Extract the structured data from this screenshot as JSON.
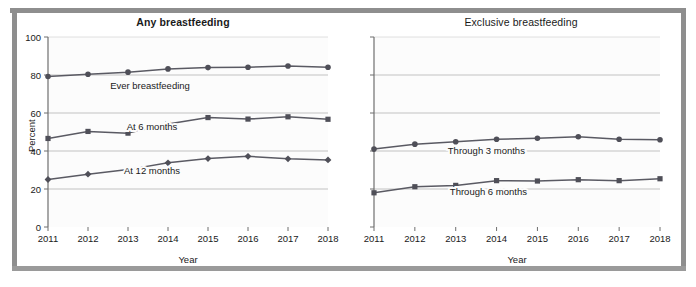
{
  "figure": {
    "background_color": "#ffffff",
    "frame_color": "#8e8e8e",
    "plot_background_color": "#fcfcfc",
    "axis_color": "#6f6f6f",
    "grid_color": "#b4b4b4",
    "line_color": "#5a5a63",
    "marker_color": "#4f4f58"
  },
  "chart_data": [
    {
      "type": "line",
      "title": "Any breastfeeding",
      "xlabel": "Year",
      "ylabel": "Percent",
      "x": [
        2011,
        2012,
        2013,
        2014,
        2015,
        2016,
        2017,
        2018
      ],
      "xticklabels": [
        "2011",
        "2012",
        "2013",
        "2014",
        "2015",
        "2016",
        "2017",
        "2018"
      ],
      "yticks": [
        0,
        20,
        40,
        60,
        80,
        100
      ],
      "yticklabels": [
        "0",
        "20",
        "40",
        "60",
        "80",
        "100"
      ],
      "ylim": [
        0,
        100
      ],
      "xlim": [
        2011,
        2018
      ],
      "grid": true,
      "grid_axis": "y",
      "legend": "inline-annotations",
      "series": [
        {
          "name": "Ever breastfeeding",
          "marker": "circle",
          "label_x": 2013.55,
          "label_y": 72.5,
          "values": [
            79.2,
            80.4,
            81.5,
            83.2,
            83.9,
            84.1,
            84.7,
            84.1
          ]
        },
        {
          "name": "At 6 months",
          "marker": "square",
          "label_x": 2013.6,
          "label_y": 51.0,
          "values": [
            46.6,
            50.3,
            49.4,
            54.2,
            57.6,
            56.8,
            58.0,
            56.7
          ]
        },
        {
          "name": "At 12 months",
          "marker": "diamond",
          "label_x": 2013.6,
          "label_y": 28.0,
          "values": [
            25.0,
            27.8,
            30.2,
            33.8,
            36.0,
            37.2,
            35.9,
            35.3
          ]
        }
      ]
    },
    {
      "type": "line",
      "title": "Exclusive breastfeeding",
      "xlabel": "Year",
      "ylabel": "",
      "x": [
        2011,
        2012,
        2013,
        2014,
        2015,
        2016,
        2017,
        2018
      ],
      "xticklabels": [
        "2011",
        "2012",
        "2013",
        "2014",
        "2015",
        "2016",
        "2017",
        "2018"
      ],
      "yticks": [
        0,
        20,
        40,
        60,
        80,
        100
      ],
      "yticklabels": [
        "",
        "",
        "",
        "",
        "",
        ""
      ],
      "ylim": [
        0,
        100
      ],
      "xlim": [
        2011,
        2018
      ],
      "grid": true,
      "grid_axis": "y",
      "legend": "inline-annotations",
      "series": [
        {
          "name": "Through 3 months",
          "marker": "circle",
          "label_x": 2013.75,
          "label_y": 38.5,
          "values": [
            41.0,
            43.6,
            44.9,
            46.2,
            46.7,
            47.5,
            46.2,
            45.9
          ]
        },
        {
          "name": "Through 6 months",
          "marker": "square",
          "label_x": 2013.8,
          "label_y": 17.0,
          "values": [
            18.0,
            21.2,
            21.9,
            24.4,
            24.2,
            24.9,
            24.4,
            25.4
          ]
        }
      ]
    }
  ]
}
